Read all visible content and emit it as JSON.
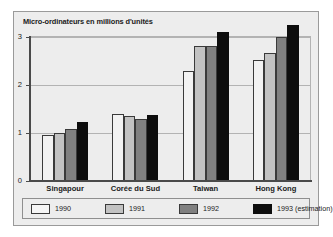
{
  "chart_data": {
    "type": "bar",
    "title": "Micro-ordinateurs en millions d'unités",
    "xlabel": "",
    "ylabel": "",
    "ylim": [
      0,
      3.4
    ],
    "yticks": [
      "0",
      "1",
      "2",
      "3"
    ],
    "grid": true,
    "legend_position": "bottom",
    "categories": [
      "Singapour",
      "Corée du Sud",
      "Taiwan",
      "Hong Kong"
    ],
    "series": [
      {
        "name": "1990",
        "color": "#f2f2f2",
        "values": [
          0.96,
          1.39,
          2.29,
          2.53
        ]
      },
      {
        "name": "1991",
        "color": "#c2c2c2",
        "values": [
          0.99,
          1.35,
          2.82,
          2.66
        ]
      },
      {
        "name": "1992",
        "color": "#808080",
        "values": [
          1.09,
          1.29,
          2.82,
          3.0
        ]
      },
      {
        "name": "1993 (estimation)",
        "color": "#0d0d0d",
        "values": [
          1.22,
          1.37,
          3.11,
          3.26
        ]
      }
    ]
  },
  "legend": {
    "entries": [
      {
        "label": "1990"
      },
      {
        "label": "1991"
      },
      {
        "label": "1992"
      },
      {
        "label": "1993 (estimation)"
      }
    ]
  }
}
